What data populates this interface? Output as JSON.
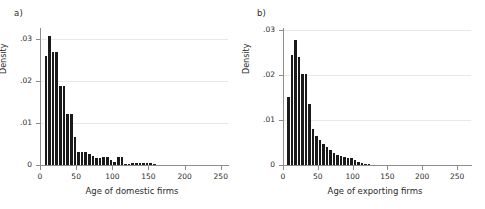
{
  "figure": {
    "background_color": "#ffffff",
    "bar_color": "#1a1a1a",
    "axis_color": "#8d8d8d",
    "grid_color": "#e8e8e8"
  },
  "panels": [
    {
      "tag": "a)",
      "ylabel": "Density",
      "xlabel": "Age of domestic firms",
      "ytick_labels": [
        "0",
        ".01",
        ".02",
        ".03"
      ],
      "xtick_labels": [
        "0",
        "50",
        "100",
        "150",
        "200",
        "250"
      ]
    },
    {
      "tag": "b)",
      "ylabel": "Density",
      "xlabel": "Age of exporting firms",
      "ytick_labels": [
        "0",
        ".01",
        ".02",
        ".03"
      ],
      "xtick_labels": [
        "0",
        "50",
        "100",
        "150",
        "200",
        "250"
      ]
    }
  ],
  "chart_data": [
    {
      "type": "bar",
      "subplot": "a)",
      "title": "",
      "xlabel": "Age of domestic firms",
      "ylabel": "Density",
      "xlim": [
        0,
        260
      ],
      "ylim": [
        0,
        0.0325
      ],
      "xticks": [
        0,
        50,
        100,
        150,
        200,
        250
      ],
      "yticks": [
        0,
        0.01,
        0.02,
        0.03
      ],
      "ytick_labels": [
        "0",
        ".01",
        ".02",
        ".03"
      ],
      "grid": "horizontal",
      "legend": "none",
      "bin_width": 5,
      "bin_starts": [
        0,
        5,
        10,
        15,
        20,
        25,
        30,
        35,
        40,
        45,
        50,
        55,
        60,
        65,
        70,
        75,
        80,
        85,
        90,
        95,
        100,
        105,
        110,
        115,
        120,
        125,
        130,
        135,
        140,
        145,
        150,
        155
      ],
      "values": [
        0.0,
        0.0259,
        0.0307,
        0.0267,
        0.0267,
        0.0188,
        0.0188,
        0.0121,
        0.0121,
        0.0067,
        0.0032,
        0.003,
        0.003,
        0.0025,
        0.0022,
        0.0016,
        0.0016,
        0.0019,
        0.0019,
        0.0011,
        0.0008,
        0.0019,
        0.0019,
        0.0003,
        0.0003,
        0.0005,
        0.0005,
        0.0005,
        0.0005,
        0.0005,
        0.0004,
        0.0003
      ]
    },
    {
      "type": "bar",
      "subplot": "b)",
      "title": "",
      "xlabel": "Age of exporting firms",
      "ylabel": "Density",
      "xlim": [
        0,
        270
      ],
      "ylim": [
        0,
        0.0305
      ],
      "xticks": [
        0,
        50,
        100,
        150,
        200,
        250
      ],
      "yticks": [
        0,
        0.01,
        0.02,
        0.03
      ],
      "ytick_labels": [
        "0",
        ".01",
        ".02",
        ".03"
      ],
      "grid": "horizontal",
      "legend": "none",
      "bin_width": 5,
      "bin_starts": [
        0,
        5,
        10,
        15,
        20,
        25,
        30,
        35,
        40,
        45,
        50,
        55,
        60,
        65,
        70,
        75,
        80,
        85,
        90,
        95,
        100,
        105,
        110,
        115,
        120
      ],
      "values": [
        0.0,
        0.0151,
        0.0245,
        0.0279,
        0.024,
        0.0202,
        0.0202,
        0.0135,
        0.008,
        0.0065,
        0.0055,
        0.0046,
        0.004,
        0.0033,
        0.0026,
        0.0022,
        0.0019,
        0.0017,
        0.0015,
        0.0015,
        0.0012,
        0.0007,
        0.0005,
        0.0003,
        0.0002
      ]
    }
  ]
}
